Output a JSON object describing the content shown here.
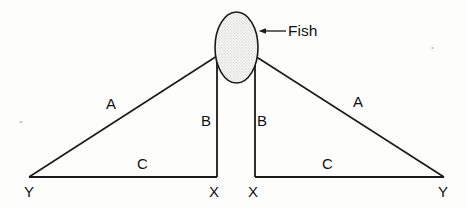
{
  "diagram": {
    "colors": {
      "ink": "#1a1a1a",
      "paper": "#fdfdfc",
      "fish_fill": "#e8e8e6"
    },
    "callout": {
      "label": "Fish",
      "arrow_direction": "left",
      "target": "fish-ellipse"
    },
    "fish": {
      "shape": "ellipse",
      "fill_pattern": "stipple"
    },
    "segments": [
      {
        "id": "a-left",
        "label": "A",
        "x": 106,
        "y": 96
      },
      {
        "id": "b-left",
        "label": "B",
        "x": 201,
        "y": 113
      },
      {
        "id": "b-right",
        "label": "B",
        "x": 257,
        "y": 113
      },
      {
        "id": "a-right",
        "label": "A",
        "x": 353,
        "y": 94
      },
      {
        "id": "c-left",
        "label": "C",
        "x": 137,
        "y": 156
      },
      {
        "id": "c-right",
        "label": "C",
        "x": 322,
        "y": 156
      }
    ],
    "vertices": [
      {
        "id": "y-left",
        "label": "Y",
        "x": 24,
        "y": 184
      },
      {
        "id": "x-left",
        "label": "X",
        "x": 209,
        "y": 184
      },
      {
        "id": "x-right",
        "label": "X",
        "x": 248,
        "y": 184
      },
      {
        "id": "y-right",
        "label": "Y",
        "x": 438,
        "y": 184
      }
    ]
  }
}
